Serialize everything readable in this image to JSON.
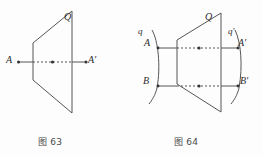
{
  "page": {
    "background_color": "#fdfdfd",
    "stroke_color": "#555555",
    "text_color": "#2b2b2b",
    "width": 263,
    "height": 156
  },
  "figures": [
    {
      "id": "fig63",
      "caption": "图 63",
      "plane_label": "Q",
      "description": "A line A A-prime pierces plane Q",
      "points": [
        {
          "name": "A",
          "label": "A"
        },
        {
          "name": "A-prime",
          "label": "A′"
        }
      ],
      "geometry": {
        "plane_vertices": "33,43 72,11 72,113 33,80",
        "line_y": 62,
        "line_x_start": 18,
        "line_x_end": 86,
        "dot_positions": [
          18,
          52.5,
          86
        ]
      }
    },
    {
      "id": "fig64",
      "caption": "图 64",
      "plane_label": "Q",
      "description": "Curve q with points A and B maps through plane Q to curve q-prime with points A-prime and B-prime",
      "curves": [
        {
          "name": "q",
          "label": "q"
        },
        {
          "name": "q-prime",
          "label": "q′"
        }
      ],
      "points": [
        {
          "name": "A",
          "label": "A"
        },
        {
          "name": "B",
          "label": "B"
        },
        {
          "name": "A-prime",
          "label": "A′"
        },
        {
          "name": "B-prime",
          "label": "B′"
        }
      ],
      "geometry": {
        "plane_vertices": "177,40 221,13 221,112 177,84",
        "upper_line_y": 48,
        "lower_line_y": 86,
        "line_x_start": 158,
        "line_x_end": 238,
        "upper_dots": [
          158,
          199,
          238
        ],
        "lower_dots": [
          158,
          199,
          238
        ]
      }
    }
  ]
}
